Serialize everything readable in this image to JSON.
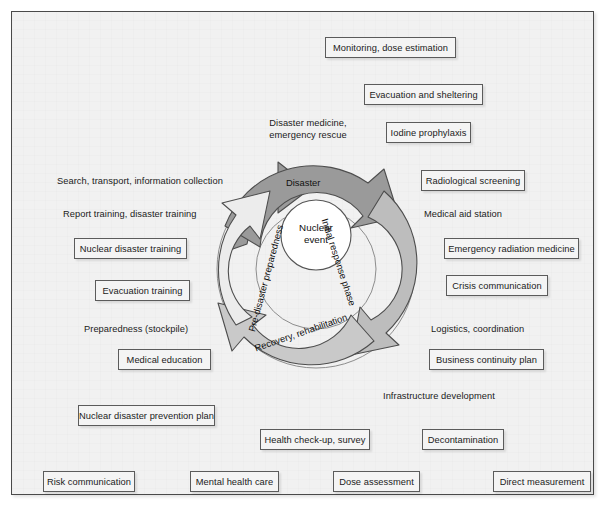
{
  "figure": {
    "center": {
      "line1": "Nuclear",
      "line2": "event"
    },
    "phases": [
      {
        "id": "disaster",
        "label": "Disaster",
        "color": "#9a9a9a"
      },
      {
        "id": "initial-response",
        "label": "Initial response phase",
        "color": "#bdbdbd"
      },
      {
        "id": "recovery",
        "label": "Recovery, rehabilitation",
        "color": "#c9c9c9"
      },
      {
        "id": "pre-disaster",
        "label": "Pre-disaster preparedness",
        "color": "#ececec"
      }
    ]
  },
  "labels": {
    "disaster_medicine": "Disaster medicine,\nemergency rescue",
    "disaster_medicine_l1": "Disaster medicine,",
    "disaster_medicine_l2": "emergency rescue",
    "search_transport": "Search, transport, information collection",
    "report_training": "Report training, disaster training",
    "preparedness_stockpile": "Preparedness (stockpile)",
    "medical_aid_station": "Medical aid station",
    "logistics_coordination": "Logistics, coordination",
    "infrastructure_development": "Infrastructure development"
  },
  "boxes": {
    "monitoring_dose_estimation": "Monitoring, dose estimation",
    "evacuation_and_sheltering": "Evacuation and sheltering",
    "iodine_prophylaxis": "Iodine prophylaxis",
    "radiological_screening": "Radiological screening",
    "emergency_radiation_medicine": "Emergency radiation medicine",
    "crisis_communication": "Crisis communication",
    "business_continuity_plan": "Business continuity plan",
    "decontamination": "Decontamination",
    "direct_measurement": "Direct measurement",
    "dose_assessment": "Dose assessment",
    "health_checkup_survey": "Health check-up, survey",
    "mental_health_care": "Mental health care",
    "risk_communication": "Risk communication",
    "nuclear_disaster_prevention_plan": "Nuclear disaster prevention plan",
    "medical_education": "Medical education",
    "evacuation_training": "Evacuation training",
    "nuclear_disaster_training": "Nuclear disaster training"
  },
  "colors": {
    "background": "#f1f1f1",
    "frame_border": "#4a4a4a",
    "box_border": "#5b5b5b",
    "arrow_stroke": "#4d4d4d",
    "arrow_disaster": "#9a9a9a",
    "arrow_initial_response": "#bdbdbd",
    "arrow_recovery": "#c9c9c9",
    "arrow_pre_disaster": "#ececec",
    "center_fill": "#ffffff"
  }
}
